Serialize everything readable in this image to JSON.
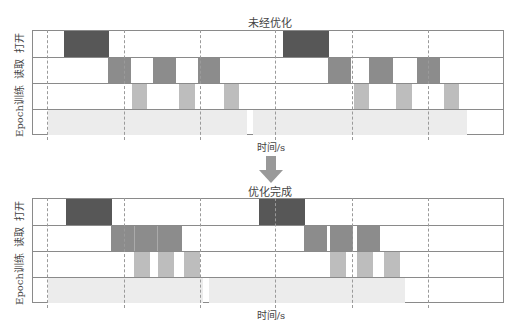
{
  "top": {
    "title": "未经优化",
    "xlabel": "时间/s"
  },
  "bottom": {
    "title": "优化完成",
    "xlabel": "时间/s"
  },
  "row_labels": [
    "打开",
    "读取",
    "训练",
    "Epoch"
  ],
  "colors": {
    "open": "#575757",
    "read": "#8c8c8c",
    "train": "#bdbdbd",
    "epoch": "#ececec",
    "grid": "#8a8a8a",
    "dash": "#9a9a9a",
    "arrow": "#999999"
  },
  "arrow": {
    "icon": "down-arrow-icon"
  }
}
